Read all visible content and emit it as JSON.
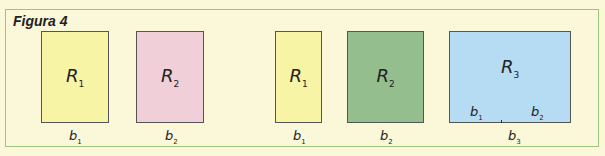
{
  "figure": {
    "title": "Figura 4",
    "colors": {
      "background": "#fbf7d9",
      "border": "#9cc47c",
      "yellow": "#f8f4a6",
      "pink": "#f1cfd9",
      "green": "#95be8e",
      "blue": "#b6dcf3"
    },
    "group1": [
      {
        "region": "R",
        "sub": "1",
        "base": "b",
        "base_sub": "1",
        "color": "#f8f4a6"
      },
      {
        "region": "R",
        "sub": "2",
        "base": "b",
        "base_sub": "2",
        "color": "#f1cfd9"
      }
    ],
    "group2": [
      {
        "region": "R",
        "sub": "1",
        "base": "b",
        "base_sub": "1",
        "color": "#f8f4a6"
      },
      {
        "region": "R",
        "sub": "2",
        "base": "b",
        "base_sub": "2",
        "color": "#95be8e"
      },
      {
        "region": "R",
        "sub": "3",
        "base": "b",
        "base_sub": "3",
        "color": "#b6dcf3",
        "inner_bases": [
          {
            "base": "b",
            "base_sub": "1"
          },
          {
            "base": "b",
            "base_sub": "2"
          }
        ]
      }
    ]
  }
}
